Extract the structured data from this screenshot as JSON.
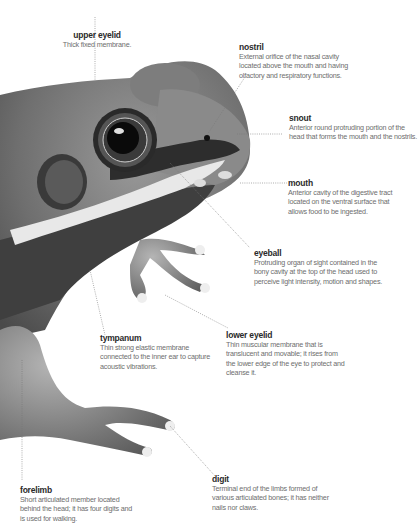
{
  "diagram": {
    "labels": [
      {
        "id": "upper-eyelid",
        "title": "upper eyelid",
        "desc": "Thick fixed membrane."
      },
      {
        "id": "nostril",
        "title": "nostril",
        "desc": "External orifice of the nasal cavity located above the mouth and having olfactory and respiratory functions."
      },
      {
        "id": "snout",
        "title": "snout",
        "desc": "Anterior round protruding portion of the head that forms the mouth and the nostrils."
      },
      {
        "id": "mouth",
        "title": "mouth",
        "desc": "Anterior cavity of the digestive tract located on the ventral surface that allows food to be ingested."
      },
      {
        "id": "eyeball",
        "title": "eyeball",
        "desc": "Protruding organ of sight contained in the bony cavity at the top of the head used to perceive light intensity, motion and shapes."
      },
      {
        "id": "tympanum",
        "title": "tympanum",
        "desc": "Thin strong elastic membrane connected to the inner ear to capture acoustic vibrations."
      },
      {
        "id": "lower-eyelid",
        "title": "lower eyelid",
        "desc": "Thin muscular membrane that is translucent and movable; it rises from the lower edge of the eye to protect and cleanse it."
      },
      {
        "id": "forelimb",
        "title": "forelimb",
        "desc": "Short articulated member located behind the head; it has four digits and is used for walking."
      },
      {
        "id": "digit",
        "title": "digit",
        "desc": "Terminal end of the limbs formed of various articulated bones; it has neither nails nor claws."
      }
    ]
  }
}
